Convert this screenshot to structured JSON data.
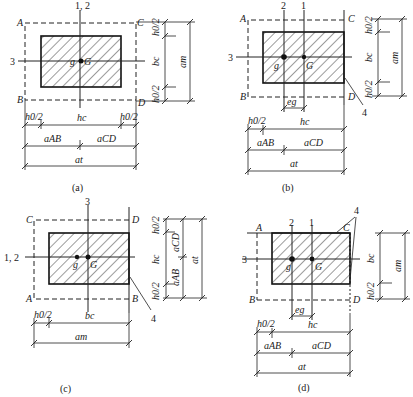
{
  "figure": {
    "panels": [
      {
        "id": "a",
        "caption": "(a)",
        "axis_labels": {
          "vertical": "1, 2",
          "horizontal": "3"
        },
        "corners": {
          "top_left": "A",
          "top_right": "C",
          "bottom_left": "B",
          "bottom_right": "D"
        },
        "points": {
          "g": "g",
          "G": "G"
        },
        "right_dims": {
          "top": "h0/2",
          "middle": "bc",
          "bottom": "h0/2",
          "total": "am"
        },
        "bottom_dims": {
          "left": "h0/2",
          "middle": "hc",
          "right": "h0/2",
          "seg1": "aAB",
          "seg2": "aCD",
          "total": "at"
        }
      },
      {
        "id": "b",
        "caption": "(b)",
        "axis_labels": {
          "line2": "2",
          "line1": "1",
          "horizontal": "3"
        },
        "corners": {
          "top_left": "A",
          "top_right": "C",
          "bottom_left": "B",
          "bottom_right": "D"
        },
        "points": {
          "g": "g",
          "G": "G"
        },
        "eccentricity": "eg",
        "edge_marker": "4",
        "right_dims": {
          "top": "h0/2",
          "middle": "bc",
          "bottom": "h0/2",
          "total": "am"
        },
        "bottom_dims": {
          "left": "h0/2",
          "middle": "hc",
          "seg1": "aAB",
          "seg2": "aCD",
          "total": "at"
        }
      },
      {
        "id": "c",
        "caption": "(c)",
        "axis_labels": {
          "vertical": "3",
          "horizontal": "1, 2"
        },
        "corners": {
          "top_left": "C",
          "top_right": "D",
          "bottom_left": "A",
          "bottom_right": "B"
        },
        "points": {
          "g": "g",
          "G": "G"
        },
        "edge_marker": "4",
        "right_dims": {
          "top": "h0/2",
          "middle": "hc",
          "bottom": "h0/2",
          "seg1": "aCD",
          "seg2": "aAB",
          "total": "at"
        },
        "bottom_dims": {
          "left": "h0/2",
          "middle": "bc",
          "total": "am"
        }
      },
      {
        "id": "d",
        "caption": "(d)",
        "axis_labels": {
          "line2": "2",
          "line1": "1",
          "horizontal": "3"
        },
        "corners": {
          "top_left": "A",
          "top_right": "C",
          "bottom_left": "B",
          "bottom_right": "D"
        },
        "points": {
          "g": "g",
          "G": "G"
        },
        "eccentricity": "eg",
        "edge_marker": "4",
        "right_dims": {
          "middle": "bc",
          "bottom": "h0/2",
          "total": "am"
        },
        "bottom_dims": {
          "left": "h0/2",
          "middle": "hc",
          "seg1": "aAB",
          "seg2": "aCD",
          "total": "at"
        }
      }
    ],
    "symbols": {
      "h0_half": "h0/2",
      "hc": "hc",
      "bc": "bc",
      "am": "am",
      "at": "at",
      "aAB": "aAB",
      "aCD": "aCD",
      "eg": "eg"
    }
  }
}
